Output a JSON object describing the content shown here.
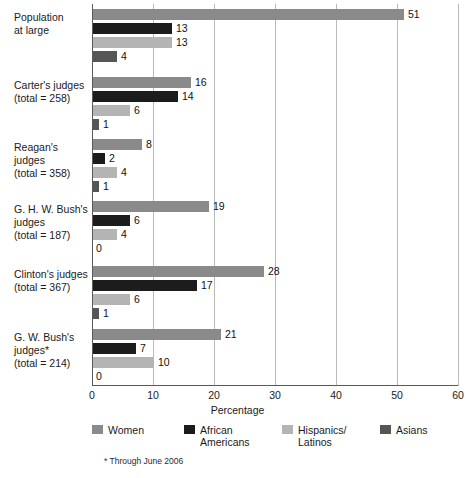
{
  "chart_data": {
    "type": "bar",
    "orientation": "horizontal",
    "title": "",
    "xlabel": "Percentage",
    "ylabel": "",
    "xlim": [
      0,
      60
    ],
    "xticks": [
      0,
      10,
      20,
      30,
      40,
      50,
      60
    ],
    "grid": "vertical",
    "legend_position": "bottom",
    "categories": [
      "Population at large",
      "Carter's judges (total = 258)",
      "Reagan's judges (total = 358)",
      "G. H. W. Bush's judges (total = 187)",
      "Clinton's judges (total = 367)",
      "G. W. Bush's judges* (total = 214)"
    ],
    "series": [
      {
        "name": "Women",
        "color": "#8a8a8a",
        "values": [
          51,
          16,
          8,
          19,
          28,
          21
        ]
      },
      {
        "name": "African Americans",
        "color": "#1c1c1c",
        "values": [
          13,
          14,
          2,
          6,
          17,
          7
        ]
      },
      {
        "name": "Hispanics/ Latinos",
        "color": "#b4b4b4",
        "values": [
          13,
          6,
          4,
          4,
          6,
          10
        ]
      },
      {
        "name": "Asians",
        "color": "#555555",
        "values": [
          4,
          1,
          1,
          0,
          1,
          0
        ]
      }
    ],
    "annotations": [
      "* Through June 2006"
    ]
  },
  "axis": {
    "xlabel": "Percentage",
    "ticks": [
      "0",
      "10",
      "20",
      "30",
      "40",
      "50",
      "60"
    ]
  },
  "rows": [
    {
      "label_lines": [
        "Population",
        "at large"
      ],
      "bars": [
        {
          "series": "Women",
          "value": 51,
          "value_text": "51"
        },
        {
          "series": "African Americans",
          "value": 13,
          "value_text": "13"
        },
        {
          "series": "Hispanics/Latinos",
          "value": 13,
          "value_text": "13"
        },
        {
          "series": "Asians",
          "value": 4,
          "value_text": "4"
        }
      ]
    },
    {
      "label_lines": [
        "Carter's judges",
        "(total = 258)"
      ],
      "bars": [
        {
          "series": "Women",
          "value": 16,
          "value_text": "16"
        },
        {
          "series": "African Americans",
          "value": 14,
          "value_text": "14"
        },
        {
          "series": "Hispanics/Latinos",
          "value": 6,
          "value_text": "6"
        },
        {
          "series": "Asians",
          "value": 1,
          "value_text": "1"
        }
      ]
    },
    {
      "label_lines": [
        "Reagan's judges",
        "(total = 358)"
      ],
      "bars": [
        {
          "series": "Women",
          "value": 8,
          "value_text": "8"
        },
        {
          "series": "African Americans",
          "value": 2,
          "value_text": "2"
        },
        {
          "series": "Hispanics/Latinos",
          "value": 4,
          "value_text": "4"
        },
        {
          "series": "Asians",
          "value": 1,
          "value_text": "1"
        }
      ]
    },
    {
      "label_lines": [
        "G. H. W. Bush's",
        "judges",
        "(total = 187)"
      ],
      "bars": [
        {
          "series": "Women",
          "value": 19,
          "value_text": "19"
        },
        {
          "series": "African Americans",
          "value": 6,
          "value_text": "6"
        },
        {
          "series": "Hispanics/Latinos",
          "value": 4,
          "value_text": "4"
        },
        {
          "series": "Asians",
          "value": 0,
          "value_text": "0"
        }
      ]
    },
    {
      "label_lines": [
        "Clinton's judges",
        "(total = 367)"
      ],
      "bars": [
        {
          "series": "Women",
          "value": 28,
          "value_text": "28"
        },
        {
          "series": "African Americans",
          "value": 17,
          "value_text": "17"
        },
        {
          "series": "Hispanics/Latinos",
          "value": 6,
          "value_text": "6"
        },
        {
          "series": "Asians",
          "value": 1,
          "value_text": "1"
        }
      ]
    },
    {
      "label_lines": [
        "G. W. Bush's",
        "judges*",
        "(total = 214)"
      ],
      "bars": [
        {
          "series": "Women",
          "value": 21,
          "value_text": "21"
        },
        {
          "series": "African Americans",
          "value": 7,
          "value_text": "7"
        },
        {
          "series": "Hispanics/Latinos",
          "value": 10,
          "value_text": "10"
        },
        {
          "series": "Asians",
          "value": 0,
          "value_text": "0"
        }
      ]
    }
  ],
  "legend": {
    "items": [
      {
        "label": "Women",
        "color": "#8a8a8a"
      },
      {
        "label": "African\nAmericans",
        "color": "#1c1c1c"
      },
      {
        "label": "Hispanics/\nLatinos",
        "color": "#b4b4b4"
      },
      {
        "label": "Asians",
        "color": "#555555"
      }
    ]
  },
  "footnote": "* Through June 2006",
  "colors": {
    "women": "#8a8a8a",
    "african_americans": "#1c1c1c",
    "hispanics_latinos": "#b4b4b4",
    "asians": "#555555",
    "gridline": "#b9b9b9",
    "axis": "#5a5a5a",
    "text": "#1a1a1a",
    "background": "#ffffff"
  }
}
